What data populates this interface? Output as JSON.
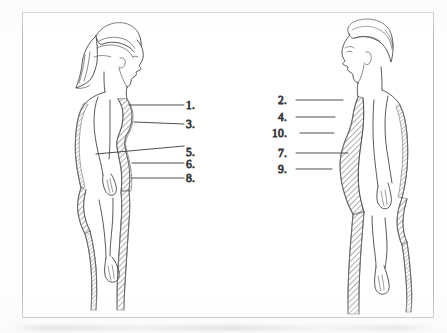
{
  "document": {
    "title": "Subcutaneous fat distribution — lateral view",
    "page_background": "#fdfdfd",
    "frame_border_color": "#b9b9bc",
    "ink_color": "#3a3a3c",
    "hatch_color": "#6f6f73"
  },
  "figures": [
    {
      "id": "female-figure",
      "name": "female-lateral-profile",
      "facing": "right",
      "description": "Female body shown in left lateral profile with shaded subcutaneous adipose tissue outlining the anterior and posterior contours"
    },
    {
      "id": "male-figure",
      "name": "male-lateral-profile",
      "facing": "left",
      "description": "Male body shown in right lateral profile with a large shaded abdominal adipose deposit"
    }
  ],
  "labels": {
    "left_column": [
      {
        "number": "1.",
        "text_x": 186,
        "text_y": 109,
        "line_x1": 184,
        "line_y1": 105,
        "line_x2": 129,
        "line_y2": 105
      },
      {
        "number": "3.",
        "text_x": 186,
        "text_y": 128,
        "line_x1": 184,
        "line_y1": 124,
        "line_x2": 134,
        "line_y2": 122
      },
      {
        "number": "5.",
        "text_x": 186,
        "text_y": 156,
        "line_x1": 184,
        "line_y1": 146,
        "line_x2": 96,
        "line_y2": 154
      },
      {
        "number": "6.",
        "text_x": 186,
        "text_y": 168,
        "line_x1": 184,
        "line_y1": 163,
        "line_x2": 132,
        "line_y2": 163
      },
      {
        "number": "8.",
        "text_x": 186,
        "text_y": 182,
        "line_x1": 184,
        "line_y1": 178,
        "line_x2": 131,
        "line_y2": 178
      }
    ],
    "right_column": [
      {
        "number": "2.",
        "text_x": 278,
        "text_y": 104,
        "line_x1": 296,
        "line_y1": 100,
        "line_x2": 343,
        "line_y2": 100
      },
      {
        "number": "4.",
        "text_x": 278,
        "text_y": 121,
        "line_x1": 296,
        "line_y1": 117,
        "line_x2": 335,
        "line_y2": 117
      },
      {
        "number": "10.",
        "text_x": 272,
        "text_y": 137,
        "line_x1": 300,
        "line_y1": 133,
        "line_x2": 334,
        "line_y2": 133
      },
      {
        "number": "7.",
        "text_x": 278,
        "text_y": 157,
        "line_x1": 296,
        "line_y1": 153,
        "line_x2": 348,
        "line_y2": 153
      },
      {
        "number": "9.",
        "text_x": 278,
        "text_y": 173,
        "line_x1": 296,
        "line_y1": 169,
        "line_x2": 332,
        "line_y2": 169
      }
    ]
  }
}
